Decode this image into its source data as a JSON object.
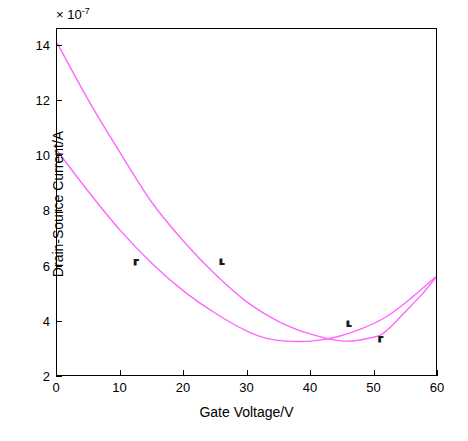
{
  "chart_data": {
    "type": "line",
    "title": "",
    "xlabel": "Gate Voltage/V",
    "ylabel": "Drain-Source Current/A",
    "y_exponent_label": "× 10",
    "y_exponent_value": "-7",
    "xlim": [
      0,
      60
    ],
    "ylim": [
      2,
      14.6
    ],
    "xticks": [
      0,
      10,
      20,
      30,
      40,
      50,
      60
    ],
    "yticks": [
      2,
      4,
      6,
      8,
      10,
      12,
      14
    ],
    "grid": false,
    "legend": null,
    "series": [
      {
        "name": "curve-1",
        "color": "#ff66ff",
        "points": [
          [
            0,
            14.1
          ],
          [
            5,
            12.0
          ],
          [
            10,
            10.1
          ],
          [
            15,
            8.3
          ],
          [
            20,
            6.9
          ],
          [
            25,
            5.7
          ],
          [
            30,
            4.7
          ],
          [
            35,
            4.0
          ],
          [
            40,
            3.55
          ],
          [
            45,
            3.3
          ],
          [
            50,
            3.45
          ],
          [
            52,
            3.7
          ],
          [
            55,
            4.4
          ],
          [
            57.5,
            5.0
          ],
          [
            60,
            5.7
          ]
        ]
      },
      {
        "name": "curve-2",
        "color": "#ff66ff",
        "points": [
          [
            0,
            10.2
          ],
          [
            5,
            8.7
          ],
          [
            10,
            7.3
          ],
          [
            15,
            6.1
          ],
          [
            20,
            5.1
          ],
          [
            25,
            4.3
          ],
          [
            30,
            3.65
          ],
          [
            33,
            3.4
          ],
          [
            36,
            3.3
          ],
          [
            40,
            3.3
          ],
          [
            44,
            3.45
          ],
          [
            48,
            3.75
          ],
          [
            52,
            4.2
          ],
          [
            56,
            4.9
          ],
          [
            60,
            5.7
          ]
        ]
      }
    ],
    "annotations": [
      {
        "name": "arrow-mark-left",
        "symbol": "⸢",
        "x": 12,
        "y": 6.25
      },
      {
        "name": "arrow-mark-mid",
        "symbol": "⸤",
        "x": 25.5,
        "y": 6.6
      },
      {
        "name": "arrow-mark-right",
        "symbol": "⸤",
        "x": 45.5,
        "y": 4.35
      },
      {
        "name": "arrow-mark-bottom",
        "symbol": "⸢",
        "x": 50.5,
        "y": 3.45
      }
    ]
  },
  "axes": {
    "x_tick_labels": [
      "0",
      "10",
      "20",
      "30",
      "40",
      "50",
      "60"
    ],
    "y_tick_labels": [
      "2",
      "4",
      "6",
      "8",
      "10",
      "12",
      "14"
    ],
    "x_title": "Gate Voltage/V",
    "y_title": "Drain-Source Current/A",
    "exponent_prefix": "× 10",
    "exponent_sup": "-7"
  }
}
